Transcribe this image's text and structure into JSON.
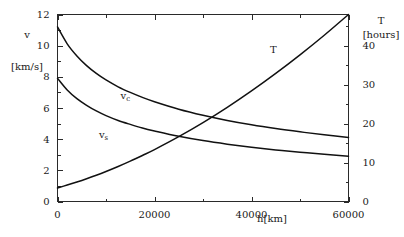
{
  "chart_data": {
    "type": "line",
    "title": "",
    "subtitle": "",
    "xlabel": "h[km]",
    "ylabel_left_symbol": "v",
    "ylabel_left_unit": "[km/s]",
    "ylabel_right_symbol": "T",
    "ylabel_right_unit": "[hours]",
    "xlim": [
      0,
      60000
    ],
    "ylim_left": [
      0,
      12
    ],
    "ylim_right": [
      0,
      48
    ],
    "grid": false,
    "legend_position": "inline-annotations",
    "x_ticks_major": [
      0,
      20000,
      40000,
      60000
    ],
    "x_tick_labels": [
      "0",
      "20000",
      "40000",
      "60000"
    ],
    "x_ticks_minor": [
      10000,
      30000,
      50000
    ],
    "y_left_ticks_major": [
      0,
      2,
      4,
      6,
      8,
      10,
      12
    ],
    "y_left_tick_labels": [
      "0",
      "2",
      "4",
      "6",
      "8",
      "10",
      "12"
    ],
    "y_left_ticks_minor": [
      1,
      3,
      5,
      7,
      9,
      11
    ],
    "y_right_ticks_major": [
      0,
      10,
      20,
      30,
      40
    ],
    "y_right_tick_labels": [
      "0",
      "10",
      "20",
      "30",
      "40"
    ],
    "y_right_ticks_minor": [
      5,
      15,
      25,
      35,
      45
    ],
    "series": [
      {
        "name": "v_c",
        "label_base": "v",
        "label_sub": "c",
        "axis": "left",
        "annotation_x": 14000,
        "annotation_y": 6.6,
        "x": [
          0,
          2000,
          4000,
          6000,
          8000,
          10000,
          12500,
          15000,
          17500,
          20000,
          25000,
          30000,
          35000,
          40000,
          45000,
          50000,
          55000,
          60000
        ],
        "values": [
          11.2,
          10.12,
          9.34,
          8.72,
          8.22,
          7.8,
          7.36,
          7.0,
          6.68,
          6.4,
          5.92,
          5.53,
          5.2,
          4.92,
          4.68,
          4.47,
          4.28,
          4.11
        ]
      },
      {
        "name": "v_s",
        "label_base": "v",
        "label_sub": "s",
        "axis": "left",
        "annotation_x": 9500,
        "annotation_y": 4.1,
        "x": [
          0,
          2000,
          4000,
          6000,
          8000,
          10000,
          12500,
          15000,
          17500,
          20000,
          25000,
          30000,
          35000,
          40000,
          45000,
          50000,
          55000,
          60000
        ],
        "values": [
          7.91,
          7.16,
          6.6,
          6.17,
          5.81,
          5.51,
          5.2,
          4.95,
          4.72,
          4.53,
          4.19,
          3.91,
          3.68,
          3.48,
          3.31,
          3.16,
          3.03,
          2.91
        ]
      },
      {
        "name": "T",
        "label_base": "T",
        "label_sub": "",
        "axis": "right",
        "annotation_x": 44500,
        "annotation_y_right": 38.0,
        "x": [
          0,
          2000,
          4000,
          6000,
          8000,
          10000,
          12500,
          15000,
          17500,
          20000,
          25000,
          30000,
          35000,
          40000,
          45000,
          50000,
          55000,
          60000
        ],
        "values": [
          1.41,
          1.71,
          2.03,
          2.37,
          2.73,
          3.12,
          3.64,
          4.2,
          4.79,
          5.4,
          6.74,
          8.2,
          9.79,
          11.5,
          13.32,
          15.25,
          17.29,
          19.45
        ]
      }
    ],
    "notes": {
      "t_right_axis_values_hours": [
        1.41,
        1.71,
        2.03,
        2.37,
        2.73,
        3.12,
        3.64,
        4.2,
        4.79,
        5.4,
        6.74,
        8.2,
        9.79,
        11.5,
        13.32,
        15.25,
        17.29,
        19.45
      ],
      "t_plotted_endpoint_hours": 48.0,
      "crossing_vc_T_approx": {
        "h": 29000,
        "v": 4.2
      }
    }
  },
  "axes": {
    "left": {
      "symbol": "v",
      "unit": "[km/s]"
    },
    "right": {
      "symbol": "T",
      "unit": "[hours]"
    },
    "bottom": {
      "title": "h[km]"
    }
  }
}
